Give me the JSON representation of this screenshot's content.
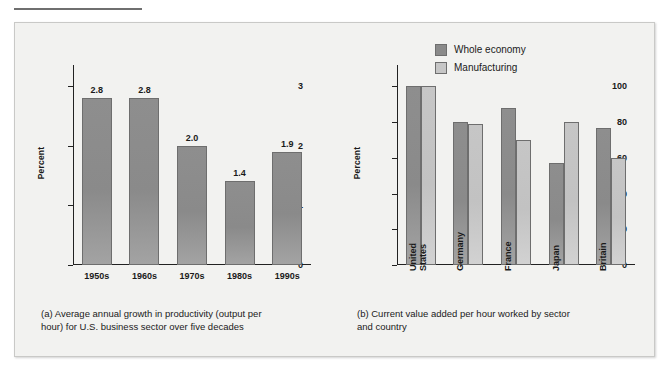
{
  "figure": {
    "background": "#f2f2f0",
    "dark_color": "#8a8a8a",
    "light_color": "#c6c6c6"
  },
  "panel_a": {
    "caption": "(a) Average annual growth in productivity (output per\n      hour) for U.S. business sector over five decades",
    "ylabel": "Percent"
  },
  "panel_b": {
    "caption": "(b) Current value added per hour worked by sector\n      and country",
    "ylabel": "Percent",
    "legend": [
      {
        "label": "Whole economy",
        "swatch": "dark"
      },
      {
        "label": "Manufacturing",
        "swatch": "light"
      }
    ]
  },
  "chart_data": [
    {
      "type": "bar",
      "id": "panel-a",
      "title": "(a) Average annual growth in productivity (output per hour) for U.S. business sector over five decades",
      "xlabel": "",
      "ylabel": "Percent",
      "ylim": [
        0,
        3.35
      ],
      "yticks": [
        0,
        1,
        2,
        3
      ],
      "ytick_labels": [
        "0",
        "1",
        "2",
        "3"
      ],
      "grid": false,
      "legend": false,
      "data_labels": true,
      "categories": [
        "1950s",
        "1960s",
        "1970s",
        "1980s",
        "1990s"
      ],
      "values": [
        2.8,
        2.8,
        2.0,
        1.4,
        1.9
      ],
      "value_labels": [
        "2.8",
        "2.8",
        "2.0",
        "1.4",
        "1.9"
      ],
      "series": [
        {
          "name": "Average annual productivity growth",
          "color": "#8a8a8a",
          "values": [
            2.8,
            2.8,
            2.0,
            1.4,
            1.9
          ]
        }
      ]
    },
    {
      "type": "bar",
      "id": "panel-b",
      "title": "(b) Current value added per hour worked by sector and country",
      "xlabel": "",
      "ylabel": "Percent",
      "ylim": [
        0,
        112
      ],
      "yticks": [
        0,
        20,
        40,
        60,
        80,
        100
      ],
      "ytick_labels": [
        "0",
        "20",
        "40",
        "60",
        "80",
        "100"
      ],
      "grid": false,
      "legend": true,
      "legend_position": "top-right",
      "data_labels": false,
      "categories": [
        "United States",
        "Germany",
        "France",
        "Japan",
        "Britain"
      ],
      "category_lines": [
        [
          "United",
          "States"
        ],
        [
          "Germany"
        ],
        [
          "France"
        ],
        [
          "Japan"
        ],
        [
          "Britain"
        ]
      ],
      "series": [
        {
          "name": "Whole economy",
          "color": "#8a8a8a",
          "values": [
            100,
            80,
            88,
            57,
            77
          ]
        },
        {
          "name": "Manufacturing",
          "color": "#c6c6c6",
          "values": [
            100,
            79,
            70,
            80,
            60
          ]
        }
      ]
    }
  ]
}
